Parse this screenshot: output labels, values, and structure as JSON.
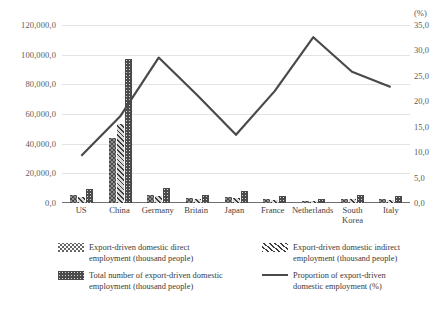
{
  "chart_data": {
    "type": "bar",
    "title": "",
    "xlabel": "",
    "ylabel": "",
    "grid": true,
    "legend_position": "bottom",
    "categories": [
      "US",
      "China",
      "Germany",
      "Britain",
      "Japan",
      "France",
      "Netherlands",
      "South Korea",
      "Italy"
    ],
    "left_axis": {
      "label": "",
      "ylim": [
        0,
        120000
      ],
      "ticks": [
        0,
        20000,
        40000,
        60000,
        80000,
        100000,
        120000
      ],
      "tick_labels": [
        "0,0",
        "20,000,0",
        "40,000,0",
        "60,000,0",
        "80,000,0",
        "100,000,0",
        "120,000,0"
      ]
    },
    "right_axis": {
      "label": "(%)",
      "ylim": [
        0,
        35
      ],
      "ticks": [
        0,
        5,
        10,
        15,
        20,
        25,
        30,
        35
      ],
      "tick_labels": [
        "0,0",
        "5,0",
        "10,0",
        "15,0",
        "20,0",
        "25,0",
        "30,0",
        "35,0"
      ]
    },
    "series": [
      {
        "name": "Export-driven domestic direct employment (thousand people)",
        "type": "bar",
        "axis": "left",
        "pattern": "zigzag-hatch",
        "values": [
          5200,
          43500,
          5600,
          3100,
          4300,
          2600,
          1500,
          2800,
          2400
        ]
      },
      {
        "name": "Export-driven domestic indirect employment (thousand people)",
        "type": "bar",
        "axis": "left",
        "pattern": "diagonal-hatch",
        "values": [
          4300,
          53500,
          4700,
          2600,
          3600,
          2200,
          1300,
          2400,
          2000
        ]
      },
      {
        "name": "Total number of export-driven domestic employment (thousand people)",
        "type": "bar",
        "axis": "left",
        "pattern": "dotted-fill",
        "values": [
          9500,
          97000,
          10300,
          5700,
          7900,
          4800,
          2800,
          5200,
          4400
        ]
      },
      {
        "name": "Proportion of export-driven domestic employment (%)",
        "type": "line",
        "axis": "right",
        "values": [
          9.3,
          17.0,
          28.6,
          21.2,
          13.4,
          22.0,
          32.6,
          25.8,
          22.8
        ]
      }
    ]
  },
  "legend": {
    "items": [
      {
        "key": "direct",
        "line1": "Export-driven domestic direct",
        "line2": "employment (thousand people)"
      },
      {
        "key": "indirect",
        "line1": "Export-driven domestic indirect",
        "line2": "employment (thousand people)"
      },
      {
        "key": "total",
        "line1": "Total number of export-driven domestic",
        "line2": "employment (thousand people)"
      },
      {
        "key": "proportion",
        "line1": "Proportion of export-driven",
        "line2": "domestic employment (%)"
      }
    ]
  },
  "colors": {
    "line": "#4a4a4a",
    "total_bar": "#4b4b4b",
    "grid": "#e3e3e3",
    "axis": "#6f6f6f",
    "text": "#3a3a3a"
  }
}
